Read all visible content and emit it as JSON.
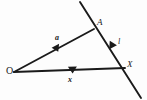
{
  "figure": {
    "kind": "vector-geometry-diagram",
    "background_color": "#fdfdfd",
    "ink_color": "#1a1a1a",
    "width": 147,
    "height": 100,
    "points": [
      {
        "id": "O",
        "label": "O",
        "x": 14,
        "y": 72
      },
      {
        "id": "A",
        "label": "A",
        "x": 94,
        "y": 29
      },
      {
        "id": "X",
        "label": "X",
        "x": 125,
        "y": 68
      }
    ],
    "vectors": [
      {
        "id": "a",
        "label": "a",
        "from": "O",
        "to": "A",
        "arrow": true
      },
      {
        "id": "x",
        "label": "x",
        "from": "O",
        "to": "X",
        "arrow": true
      }
    ],
    "lines": [
      {
        "id": "l",
        "label": "l",
        "through": [
          "A",
          "X"
        ],
        "x1": 80,
        "y1": 2,
        "x2": 141,
        "y2": 98,
        "arrow_midpoint": true
      }
    ],
    "labels": {
      "origin": "O",
      "point_a": "A",
      "point_x": "X",
      "vector_a": "a",
      "vector_x": "x",
      "line_l": "l"
    }
  }
}
